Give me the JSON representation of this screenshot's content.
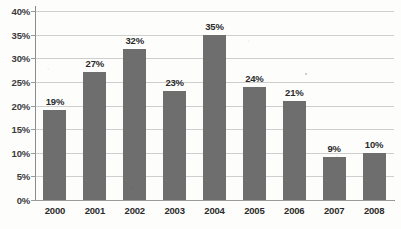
{
  "chart_data": {
    "type": "bar",
    "title": "",
    "xlabel": "",
    "ylabel": "",
    "categories": [
      "2000",
      "2001",
      "2002",
      "2003",
      "2004",
      "2005",
      "2006",
      "2007",
      "2008"
    ],
    "values": [
      19,
      27,
      32,
      23,
      35,
      24,
      21,
      9,
      10
    ],
    "value_labels": [
      "19%",
      "27%",
      "32%",
      "23%",
      "35%",
      "24%",
      "21%",
      "9%",
      "10%"
    ],
    "ylim": [
      0,
      40
    ],
    "ytick_values": [
      0,
      5,
      10,
      15,
      20,
      25,
      30,
      35,
      40
    ],
    "ytick_labels": [
      "0%",
      "5%",
      "10%",
      "15%",
      "20%",
      "25%",
      "30%",
      "35%",
      "40%"
    ],
    "grid": "horizontal",
    "legend": "none",
    "series": [
      {
        "name": "",
        "values": [
          19,
          27,
          32,
          23,
          35,
          24,
          21,
          9,
          10
        ]
      }
    ],
    "colors": {
      "bar": "#6e6e6e",
      "gridline": "#cfcfcf",
      "axis": "#8c8c8c",
      "text": "#2b2b2b",
      "background": "#fdfdfc"
    }
  }
}
